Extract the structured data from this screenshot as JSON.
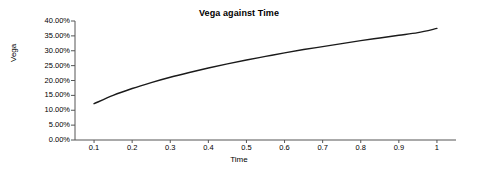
{
  "chart_data": {
    "type": "line",
    "title": "Vega against Time",
    "xlabel": "Time",
    "ylabel": "Vega",
    "grid": false,
    "legend": false,
    "xlim": [
      0.05,
      1.05
    ],
    "ylim": [
      0,
      0.4
    ],
    "xticks": [
      "0.1",
      "0.2",
      "0.3",
      "0.4",
      "0.5",
      "0.6",
      "0.7",
      "0.8",
      "0.9",
      "1"
    ],
    "xtick_values": [
      0.1,
      0.2,
      0.3,
      0.4,
      0.5,
      0.6,
      0.7,
      0.8,
      0.9,
      1.0
    ],
    "yticks": [
      "0.00%",
      "5.00%",
      "10.00%",
      "15.00%",
      "20.00%",
      "25.00%",
      "30.00%",
      "35.00%",
      "40.00%"
    ],
    "ytick_values": [
      0.0,
      0.05,
      0.1,
      0.15,
      0.2,
      0.25,
      0.3,
      0.35,
      0.4
    ],
    "series": [
      {
        "name": "Vega",
        "color": "#1a1a1a",
        "x": [
          0.1,
          0.15,
          0.2,
          0.25,
          0.3,
          0.35,
          0.4,
          0.45,
          0.5,
          0.55,
          0.6,
          0.65,
          0.7,
          0.75,
          0.8,
          0.85,
          0.9,
          0.95,
          1.0
        ],
        "values": [
          0.122,
          0.15,
          0.173,
          0.193,
          0.211,
          0.227,
          0.242,
          0.256,
          0.269,
          0.281,
          0.293,
          0.304,
          0.314,
          0.324,
          0.334,
          0.343,
          0.352,
          0.361,
          0.375
        ]
      }
    ]
  },
  "axis": {
    "y_title": "Vega",
    "x_title": "Time"
  }
}
